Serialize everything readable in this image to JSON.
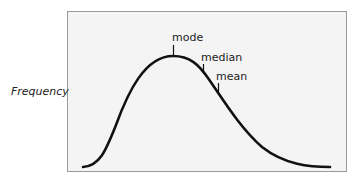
{
  "diagram": {
    "y_axis_label": "Frequency",
    "distribution": {
      "shape": "right-skewed",
      "curve_color": "#111111",
      "panel_fill": "#f4f4f4",
      "panel_border": "#9a9a9a"
    },
    "markers": [
      {
        "id": "mode",
        "label": "mode"
      },
      {
        "id": "median",
        "label": "median"
      },
      {
        "id": "mean",
        "label": "mean"
      }
    ]
  }
}
